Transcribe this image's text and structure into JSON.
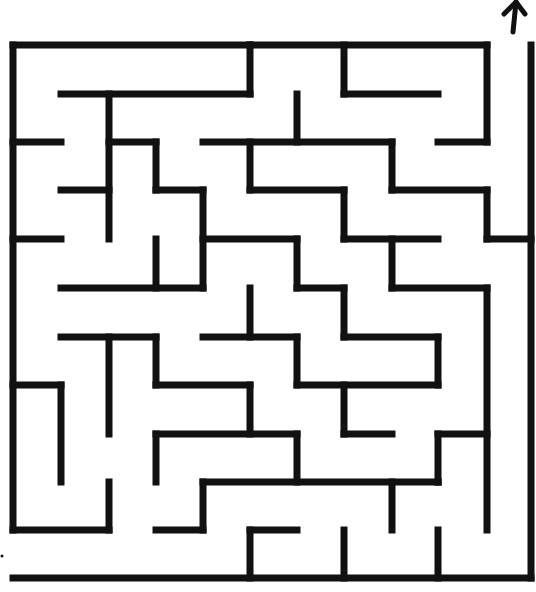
{
  "colors": {
    "wall": "#111111",
    "background": "#ffffff"
  },
  "stroke_width": 7,
  "exit": {
    "label": "exit-arrow",
    "direction": "up",
    "x": 515,
    "y": 30
  },
  "entry": {
    "label": "entry-mark",
    "x": 3,
    "y": 556
  },
  "walls": [
    [
      13,
      45,
      250,
      45
    ],
    [
      250,
      45,
      487,
      45
    ],
    [
      13,
      45,
      13,
      530
    ],
    [
      250,
      45,
      250,
      94
    ],
    [
      344,
      45,
      344,
      94
    ],
    [
      487,
      45,
      487,
      142
    ],
    [
      61,
      94,
      250,
      94
    ],
    [
      344,
      94,
      438,
      94
    ],
    [
      109,
      94,
      109,
      239
    ],
    [
      297,
      94,
      297,
      142
    ],
    [
      13,
      142,
      61,
      142
    ],
    [
      109,
      142,
      156,
      142
    ],
    [
      156,
      142,
      156,
      190
    ],
    [
      203,
      142,
      392,
      142
    ],
    [
      250,
      142,
      250,
      190
    ],
    [
      438,
      142,
      487,
      142
    ],
    [
      61,
      190,
      109,
      190
    ],
    [
      156,
      190,
      203,
      190
    ],
    [
      203,
      190,
      203,
      288
    ],
    [
      250,
      190,
      344,
      190
    ],
    [
      344,
      190,
      344,
      239
    ],
    [
      392,
      142,
      392,
      190
    ],
    [
      392,
      190,
      487,
      190
    ],
    [
      487,
      190,
      487,
      239
    ],
    [
      487,
      239,
      531,
      239
    ],
    [
      531,
      45,
      531,
      578
    ],
    [
      13,
      239,
      61,
      239
    ],
    [
      156,
      239,
      156,
      288
    ],
    [
      203,
      239,
      297,
      239
    ],
    [
      297,
      239,
      297,
      288
    ],
    [
      344,
      239,
      438,
      239
    ],
    [
      392,
      239,
      392,
      288
    ],
    [
      61,
      288,
      203,
      288
    ],
    [
      297,
      288,
      344,
      288
    ],
    [
      344,
      288,
      344,
      337
    ],
    [
      392,
      288,
      487,
      288
    ],
    [
      487,
      288,
      487,
      530
    ],
    [
      250,
      288,
      250,
      337
    ],
    [
      61,
      337,
      156,
      337
    ],
    [
      109,
      337,
      109,
      434
    ],
    [
      156,
      337,
      156,
      385
    ],
    [
      203,
      337,
      297,
      337
    ],
    [
      297,
      337,
      297,
      385
    ],
    [
      344,
      337,
      438,
      337
    ],
    [
      438,
      337,
      438,
      385
    ],
    [
      13,
      385,
      61,
      385
    ],
    [
      61,
      385,
      61,
      482
    ],
    [
      156,
      385,
      250,
      385
    ],
    [
      250,
      385,
      250,
      434
    ],
    [
      297,
      385,
      438,
      385
    ],
    [
      344,
      385,
      344,
      434
    ],
    [
      156,
      434,
      297,
      434
    ],
    [
      156,
      434,
      156,
      482
    ],
    [
      297,
      434,
      297,
      482
    ],
    [
      344,
      434,
      392,
      434
    ],
    [
      438,
      434,
      487,
      434
    ],
    [
      438,
      434,
      438,
      482
    ],
    [
      109,
      482,
      109,
      530
    ],
    [
      203,
      482,
      438,
      482
    ],
    [
      203,
      482,
      203,
      530
    ],
    [
      392,
      482,
      392,
      530
    ],
    [
      13,
      530,
      109,
      530
    ],
    [
      156,
      530,
      203,
      530
    ],
    [
      250,
      530,
      297,
      530
    ],
    [
      250,
      530,
      250,
      578
    ],
    [
      344,
      530,
      344,
      578
    ],
    [
      438,
      530,
      438,
      578
    ],
    [
      438,
      482,
      438,
      482
    ],
    [
      13,
      578,
      531,
      578
    ]
  ]
}
